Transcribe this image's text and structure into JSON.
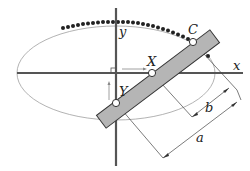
{
  "diagram": {
    "axes": {
      "x_label": "x",
      "y_label": "y"
    },
    "points": [
      {
        "name": "C",
        "label": "C"
      },
      {
        "name": "X",
        "label": "X"
      },
      {
        "name": "Y",
        "label": "Y"
      }
    ],
    "dimensions": [
      {
        "name": "a",
        "label": "a"
      },
      {
        "name": "b",
        "label": "b"
      }
    ],
    "colors": {
      "axis": "#555555",
      "ellipse": "#9a9a9a",
      "rod_fill": "#b5b5b5",
      "rod_stroke": "#333333",
      "dots": "#222222",
      "dimension_lines": "#444444"
    }
  }
}
